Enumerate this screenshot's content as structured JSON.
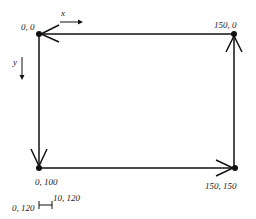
{
  "diagram": {
    "type": "coordinate-path-diagram",
    "axes": {
      "x_label": "x",
      "y_label": "y"
    },
    "points": [
      {
        "id": "p0",
        "label": "0, 0"
      },
      {
        "id": "p1",
        "label": "150, 0"
      },
      {
        "id": "p2",
        "label": "150, 150"
      },
      {
        "id": "p3",
        "label": "0, 100"
      }
    ],
    "edges": [
      {
        "from": "0, 0",
        "to": "0, 100",
        "direction": "down"
      },
      {
        "from": "0, 100",
        "to": "150, 150",
        "direction": "right"
      },
      {
        "from": "150, 150",
        "to": "150, 0",
        "direction": "up"
      },
      {
        "from": "150, 0",
        "to": "0, 0",
        "direction": "left"
      }
    ],
    "scale_marker": {
      "start_label": "0, 120",
      "end_label": "10, 120"
    },
    "colors": {
      "stroke": "#111111",
      "background": "#ffffff"
    }
  }
}
